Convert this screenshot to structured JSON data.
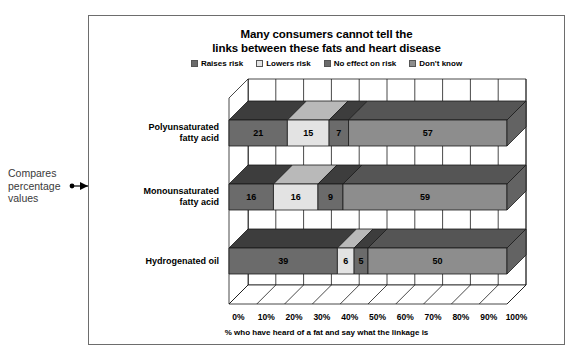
{
  "annotation": {
    "text": "Compares percentage values",
    "icon": "arrow-right-icon"
  },
  "chart_data": {
    "type": "bar",
    "orientation": "horizontal",
    "stacked": true,
    "style": "3d-isometric",
    "title": "Many consumers cannot tell the links between these fats and heart disease",
    "title_line1": "Many consumers cannot tell the",
    "title_line2": "links between these fats and heart disease",
    "xlabel": "% who have heard of a fat and say what the linkage is",
    "ylabel": "",
    "xlim": [
      0,
      100
    ],
    "xticks": [
      "0%",
      "10%",
      "20%",
      "30%",
      "40%",
      "50%",
      "60%",
      "70%",
      "80%",
      "90%",
      "100%"
    ],
    "grid": true,
    "legend_position": "top",
    "categories": [
      "Polyunsaturated fatty acid",
      "Monounsaturated fatty acid",
      "Hydrogenated oil"
    ],
    "categories_lines": [
      [
        "Polyunsaturated",
        "fatty acid"
      ],
      [
        "Monounsaturated",
        "fatty acid"
      ],
      [
        "Hydrogenated oil"
      ]
    ],
    "series": [
      {
        "name": "Raises risk",
        "color": "#6b6b6b",
        "top_color": "#3d3d3d",
        "side_color": "#4a4a4a",
        "values": [
          21,
          16,
          39
        ]
      },
      {
        "name": "Lowers risk",
        "color": "#e3e3e3",
        "top_color": "#b9b9b9",
        "side_color": "#c8c8c8",
        "values": [
          15,
          16,
          6
        ]
      },
      {
        "name": "No effect on risk",
        "color": "#6b6b6b",
        "top_color": "#3d3d3d",
        "side_color": "#4a4a4a",
        "values": [
          7,
          9,
          5
        ]
      },
      {
        "name": "Don't know",
        "color": "#8d8d8d",
        "top_color": "#555555",
        "side_color": "#636363",
        "values": [
          57,
          59,
          50
        ]
      }
    ]
  }
}
